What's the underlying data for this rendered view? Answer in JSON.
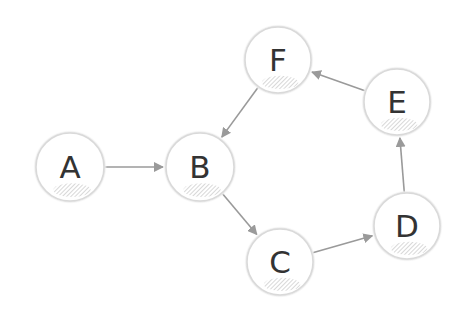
{
  "diagram": {
    "type": "directed-graph",
    "colors": {
      "background": "#ffffff",
      "node_fill": "#ffffff",
      "node_border": "#d9d9d9",
      "node_shadow": "#bdbdbd",
      "edge": "#9a9a9a",
      "label": "#333333"
    },
    "nodes": [
      {
        "id": "A",
        "label": "A",
        "cx": 70,
        "cy": 167,
        "r": 34
      },
      {
        "id": "B",
        "label": "B",
        "cx": 200,
        "cy": 167,
        "r": 34
      },
      {
        "id": "C",
        "label": "C",
        "cx": 280,
        "cy": 262,
        "r": 33
      },
      {
        "id": "D",
        "label": "D",
        "cx": 407,
        "cy": 226,
        "r": 33
      },
      {
        "id": "E",
        "label": "E",
        "cx": 397,
        "cy": 102,
        "r": 33
      },
      {
        "id": "F",
        "label": "F",
        "cx": 278,
        "cy": 60,
        "r": 33
      }
    ],
    "edges": [
      {
        "from": "A",
        "to": "B"
      },
      {
        "from": "B",
        "to": "C"
      },
      {
        "from": "C",
        "to": "D"
      },
      {
        "from": "D",
        "to": "E"
      },
      {
        "from": "E",
        "to": "F"
      },
      {
        "from": "F",
        "to": "B"
      }
    ]
  }
}
